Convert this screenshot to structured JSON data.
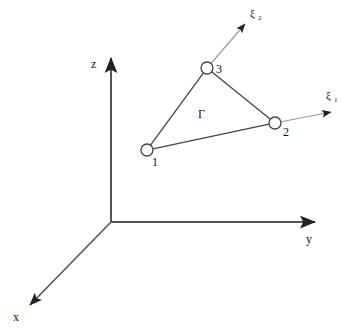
{
  "figure": {
    "background_color": "#ffffff",
    "line_color": "#444444",
    "axis_color": "#555555",
    "text_color": "#111111",
    "node_fill": "#ffffff",
    "width": 341,
    "height": 334
  },
  "global_axes": [
    {
      "id": "x",
      "label": "x",
      "label_x": 13,
      "label_y": 321,
      "tip_x": 30,
      "tip_y": 305,
      "origin_x": 111,
      "origin_y": 222
    },
    {
      "id": "y",
      "label": "y",
      "label_x": 306,
      "label_y": 243,
      "tip_x": 315,
      "tip_y": 222,
      "origin_x": 111,
      "origin_y": 222
    },
    {
      "id": "z",
      "label": "z",
      "label_x": 91,
      "label_y": 68,
      "tip_x": 111,
      "tip_y": 58,
      "origin_x": 111,
      "origin_y": 222
    }
  ],
  "local_axes": [
    {
      "id": "xi1",
      "symbol": "ξ",
      "subscript": "1",
      "label_x": 326,
      "label_y": 99,
      "sub_x": 334,
      "sub_y": 102,
      "start_x": 275,
      "start_y": 123,
      "tip_x": 331,
      "tip_y": 112
    },
    {
      "id": "xi2",
      "symbol": "ξ",
      "subscript": "2",
      "label_x": 250,
      "label_y": 17,
      "sub_x": 258,
      "sub_y": 20,
      "start_x": 207,
      "start_y": 68,
      "tip_x": 245,
      "tip_y": 24
    }
  ],
  "element": {
    "region_label": "Γ",
    "region_label_x": 198,
    "region_label_y": 118,
    "nodes": [
      {
        "number": "1",
        "cx": 147,
        "cy": 150,
        "r": 6,
        "label_x": 152,
        "label_y": 166
      },
      {
        "number": "2",
        "cx": 275,
        "cy": 123,
        "r": 6,
        "label_x": 283,
        "label_y": 136
      },
      {
        "number": "3",
        "cx": 207,
        "cy": 68,
        "r": 6,
        "label_x": 216,
        "label_y": 73
      }
    ],
    "edges": [
      {
        "from": "1",
        "to": "2"
      },
      {
        "from": "2",
        "to": "3"
      },
      {
        "from": "3",
        "to": "1"
      }
    ]
  }
}
